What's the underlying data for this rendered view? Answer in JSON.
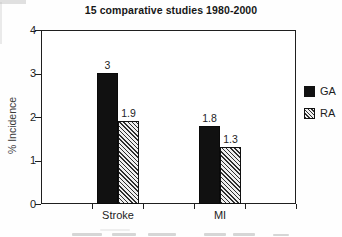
{
  "title": "15 comparative studies 1980-2000",
  "y_axis": {
    "label": "% Incidence",
    "tick_labels": [
      "4",
      "3",
      "2",
      "1",
      "0"
    ]
  },
  "x_axis": {
    "category_labels": [
      "Stroke",
      "MI"
    ]
  },
  "legend": {
    "items": [
      {
        "label": "GA",
        "swatch": "solid-black-square"
      },
      {
        "label": "RA",
        "swatch": "diagonal-hatch-square"
      }
    ]
  },
  "chart_data": {
    "type": "bar",
    "title": "15 comparative studies 1980-2000",
    "categories": [
      "Stroke",
      "MI"
    ],
    "series": [
      {
        "name": "GA",
        "values": [
          3,
          1.8
        ],
        "fill": "solid",
        "color": "#111111"
      },
      {
        "name": "RA",
        "values": [
          1.9,
          1.3
        ],
        "fill": "diagonal-hatch",
        "color": "#333333"
      }
    ],
    "value_labels": {
      "GA": [
        "3",
        "1.8"
      ],
      "RA": [
        "1.9",
        "1.3"
      ]
    },
    "xlabel": "",
    "ylabel": "% Incidence",
    "ylim": [
      0,
      4
    ],
    "yticks": [
      0,
      1,
      2,
      3,
      4
    ],
    "grid": false,
    "legend_position": "right-outside"
  }
}
